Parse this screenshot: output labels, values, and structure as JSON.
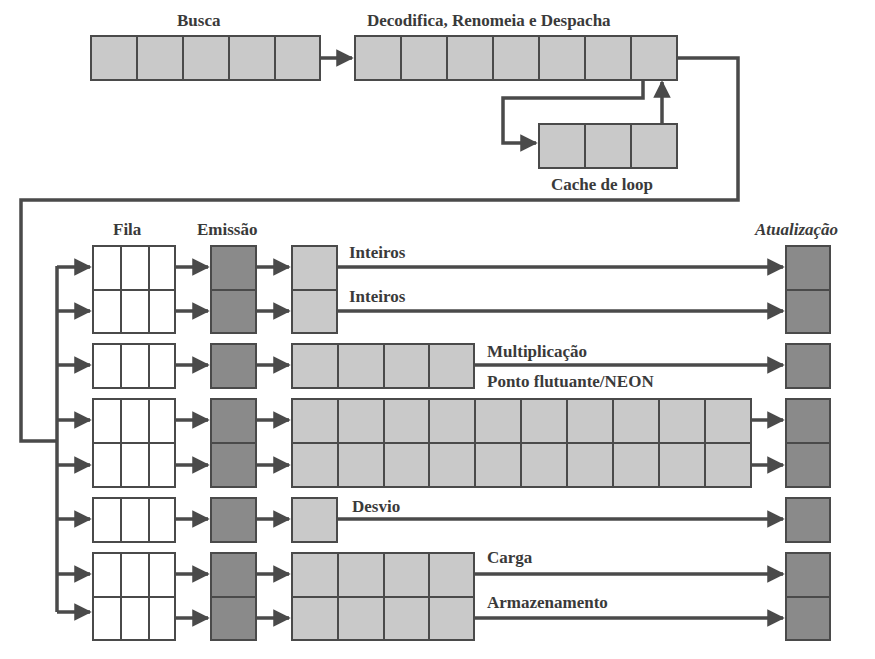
{
  "colors": {
    "stage_light": "#c9c9c9",
    "stage_dark": "#8a8a8a",
    "queue": "#ffffff",
    "line": "#4a4a4a",
    "text": "#3a3a3a"
  },
  "labels": {
    "fetch": "Busca",
    "decode": "Decodifica, Renomeia e Despacha",
    "loop_cache": "Cache de loop",
    "queue": "Fila",
    "issue": "Emissão",
    "writeback": "Atualização"
  },
  "fetch_stage": {
    "cells": 5
  },
  "decode_stage": {
    "cells": 7
  },
  "loop_cache_stage": {
    "cells": 3
  },
  "execution_units": [
    {
      "label": "Inteiros",
      "exec_cells": 1,
      "queue_cells": 3,
      "issue": "dark",
      "writeback": "dark"
    },
    {
      "label": "Inteiros",
      "exec_cells": 1,
      "queue_cells": 3,
      "issue": "dark",
      "writeback": "dark"
    },
    {
      "label": "Multiplicação",
      "exec_cells": 4,
      "queue_cells": 3,
      "issue": "dark",
      "writeback": "dark"
    },
    {
      "label": "Ponto flutuante/NEON",
      "exec_cells": 10,
      "queue_cells": 3,
      "issue": "dark",
      "writeback": "dark",
      "rows": 2
    },
    {
      "label": "Desvio",
      "exec_cells": 1,
      "queue_cells": 3,
      "issue": "dark",
      "writeback": "dark"
    },
    {
      "label": "Carga",
      "exec_cells": 4,
      "queue_cells": 3,
      "issue": "dark",
      "writeback": "dark"
    },
    {
      "label": "Armazenamento",
      "exec_cells": 4,
      "queue_cells": 3,
      "issue": "dark",
      "writeback": "dark"
    }
  ]
}
